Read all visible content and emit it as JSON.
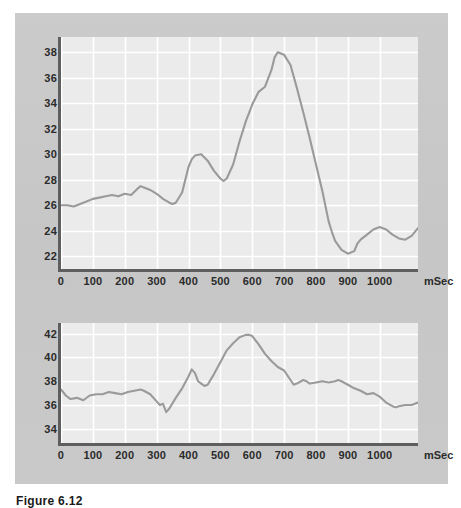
{
  "figure": {
    "caption": "Figure 6.12",
    "panel_color": "#c9c9c9",
    "plot_bg_color": "#ebebeb",
    "gridline_color": "#ffffff",
    "line_color": "#9a9a9a",
    "axis_color": "#5e5e5e"
  },
  "chart_data": [
    {
      "id": "top",
      "type": "line",
      "title": "",
      "xlabel": "mSec",
      "ylabel": "",
      "xlim": [
        0,
        1120
      ],
      "ylim": [
        21.0,
        39.2
      ],
      "grid": true,
      "legend": "none",
      "xticks": [
        0,
        100,
        200,
        300,
        400,
        500,
        600,
        700,
        800,
        900,
        1000
      ],
      "xticklabels": [
        "0",
        "100",
        "200",
        "300",
        "400",
        "500",
        "600",
        "700",
        "800",
        "900",
        "1000"
      ],
      "yticks": [
        22,
        24,
        26,
        28,
        30,
        32,
        34,
        36,
        38
      ],
      "yticklabels": [
        "22",
        "24",
        "26",
        "28",
        "30",
        "32",
        "34",
        "36",
        "38"
      ],
      "series": [
        {
          "name": "signal",
          "x": [
            0,
            20,
            40,
            60,
            80,
            100,
            120,
            140,
            160,
            180,
            200,
            220,
            240,
            250,
            260,
            280,
            300,
            320,
            340,
            350,
            360,
            380,
            400,
            410,
            420,
            440,
            460,
            480,
            500,
            510,
            520,
            540,
            560,
            580,
            600,
            620,
            640,
            660,
            670,
            680,
            700,
            720,
            740,
            760,
            780,
            800,
            820,
            840,
            850,
            860,
            880,
            900,
            920,
            930,
            940,
            960,
            980,
            1000,
            1020,
            1040,
            1060,
            1080,
            1100,
            1120
          ],
          "values": [
            26.0,
            26.0,
            25.9,
            26.1,
            26.3,
            26.5,
            26.6,
            26.7,
            26.8,
            26.7,
            26.9,
            26.8,
            27.3,
            27.5,
            27.4,
            27.2,
            26.9,
            26.5,
            26.2,
            26.1,
            26.2,
            27.0,
            29.0,
            29.6,
            29.9,
            30.0,
            29.5,
            28.7,
            28.1,
            27.9,
            28.1,
            29.2,
            31.0,
            32.6,
            33.9,
            34.9,
            35.3,
            36.6,
            37.6,
            38.0,
            37.8,
            37.0,
            35.2,
            33.3,
            31.3,
            29.2,
            27.1,
            24.7,
            23.9,
            23.2,
            22.5,
            22.2,
            22.4,
            23.0,
            23.3,
            23.7,
            24.1,
            24.3,
            24.1,
            23.7,
            23.4,
            23.3,
            23.6,
            24.2
          ]
        }
      ]
    },
    {
      "id": "bottom",
      "type": "line",
      "title": "",
      "xlabel": "mSec",
      "ylabel": "",
      "xlim": [
        0,
        1120
      ],
      "ylim": [
        32.8,
        42.9
      ],
      "grid": true,
      "legend": "none",
      "xticks": [
        0,
        100,
        200,
        300,
        400,
        500,
        600,
        700,
        800,
        900,
        1000
      ],
      "xticklabels": [
        "0",
        "100",
        "200",
        "300",
        "400",
        "500",
        "600",
        "700",
        "800",
        "900",
        "1000"
      ],
      "yticks": [
        34,
        36,
        38,
        40,
        42
      ],
      "yticklabels": [
        "34",
        "36",
        "38",
        "40",
        "42"
      ],
      "series": [
        {
          "name": "signal",
          "x": [
            0,
            15,
            30,
            50,
            70,
            90,
            110,
            130,
            150,
            170,
            190,
            210,
            230,
            250,
            260,
            280,
            300,
            310,
            320,
            330,
            340,
            360,
            380,
            400,
            410,
            420,
            430,
            440,
            450,
            460,
            480,
            500,
            520,
            540,
            560,
            580,
            590,
            600,
            620,
            640,
            660,
            680,
            700,
            720,
            730,
            740,
            760,
            770,
            780,
            800,
            820,
            840,
            860,
            870,
            880,
            900,
            920,
            940,
            960,
            980,
            1000,
            1020,
            1040,
            1050,
            1060,
            1080,
            1100,
            1120
          ],
          "values": [
            37.3,
            36.8,
            36.5,
            36.6,
            36.4,
            36.8,
            36.9,
            36.9,
            37.1,
            37.0,
            36.9,
            37.1,
            37.2,
            37.3,
            37.2,
            36.9,
            36.3,
            36.0,
            36.1,
            35.4,
            35.7,
            36.6,
            37.4,
            38.4,
            39.0,
            38.7,
            38.0,
            37.8,
            37.6,
            37.7,
            38.6,
            39.6,
            40.6,
            41.2,
            41.7,
            41.9,
            41.9,
            41.8,
            41.1,
            40.3,
            39.7,
            39.2,
            38.9,
            38.1,
            37.7,
            37.8,
            38.1,
            38.0,
            37.8,
            37.9,
            38.0,
            37.9,
            38.0,
            38.1,
            38.0,
            37.7,
            37.4,
            37.2,
            36.9,
            37.0,
            36.7,
            36.2,
            35.9,
            35.8,
            35.9,
            36.0,
            36.0,
            36.2
          ]
        }
      ]
    }
  ]
}
